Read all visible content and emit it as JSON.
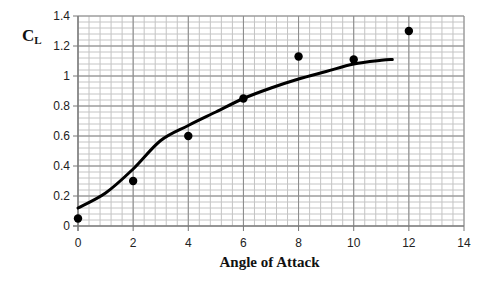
{
  "chart_data": {
    "type": "scatter",
    "title": "",
    "xlabel": "Angle of Attack",
    "ylabel": "C",
    "ylabel_sub": "L",
    "xlim": [
      0,
      14
    ],
    "ylim": [
      0,
      1.4
    ],
    "x_ticks": [
      0,
      2,
      4,
      6,
      8,
      10,
      12,
      14
    ],
    "y_ticks": [
      0,
      0.2,
      0.4,
      0.6,
      0.8,
      1,
      1.2,
      1.4
    ],
    "y_tick_labels": [
      "0",
      "0.2",
      "0.4",
      "0.6",
      "0.8",
      "1",
      "1.2",
      "1.4"
    ],
    "grid": true,
    "legend": null,
    "series": [
      {
        "name": "Measured",
        "type": "scatter",
        "x": [
          0,
          2,
          4,
          6,
          8,
          10,
          12
        ],
        "y": [
          0.05,
          0.3,
          0.6,
          0.85,
          1.13,
          1.11,
          1.3
        ]
      },
      {
        "name": "Fit curve",
        "type": "line",
        "x": [
          0,
          1,
          2,
          3,
          4,
          5,
          6,
          7,
          8,
          9,
          10,
          11,
          11.4
        ],
        "y": [
          0.12,
          0.22,
          0.38,
          0.57,
          0.67,
          0.76,
          0.85,
          0.92,
          0.98,
          1.03,
          1.08,
          1.105,
          1.11
        ]
      }
    ]
  }
}
